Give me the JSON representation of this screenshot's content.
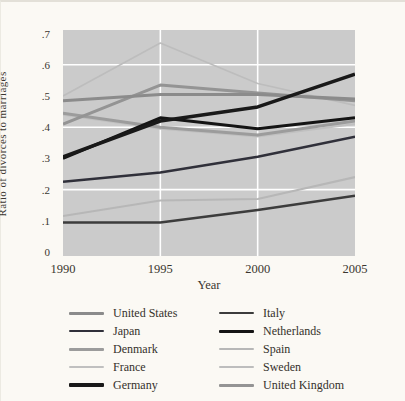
{
  "figure": {
    "ylabel": "Ratio of divorces to marriages",
    "xlabel": "Year"
  },
  "colors": {
    "page_bg": "#fbf9f4",
    "plot_bg": "#cbcbcb",
    "grid": "#ffffff",
    "text": "#35312b"
  },
  "chart_data": {
    "type": "line",
    "title": "",
    "xlabel": "Year",
    "ylabel": "Ratio of divorces to marriages",
    "x": [
      1990,
      1995,
      2000,
      2005
    ],
    "x_tick_labels": [
      "1990",
      "1995",
      "2000",
      "2005"
    ],
    "y_ticks": [
      {
        "v": 0.7,
        "label": ".7"
      },
      {
        "v": 0.6,
        "label": ".6"
      },
      {
        "v": 0.5,
        "label": ".5"
      },
      {
        "v": 0.4,
        "label": ".4"
      },
      {
        "v": 0.3,
        "label": ".3"
      },
      {
        "v": 0.2,
        "label": ".2"
      },
      {
        "v": 0.1,
        "label": ".1"
      },
      {
        "v": 0.0,
        "label": "0"
      }
    ],
    "ylim": [
      0,
      0.72
    ],
    "grid": {
      "horizontal_values": [
        0.2,
        0.4,
        0.6
      ],
      "vertical_years": [
        1995,
        2000
      ]
    },
    "legend_position": "bottom-two-columns",
    "series": [
      {
        "name": "United States",
        "color": "#8b8b8b",
        "width": 3,
        "values": [
          0.485,
          0.505,
          0.505,
          0.49
        ]
      },
      {
        "name": "Japan",
        "color": "#30303a",
        "width": 2.5,
        "values": [
          0.225,
          0.255,
          0.305,
          0.37
        ]
      },
      {
        "name": "Denmark",
        "color": "#9c9c9c",
        "width": 3,
        "values": [
          0.445,
          0.4,
          0.375,
          0.42
        ]
      },
      {
        "name": "France",
        "color": "#c0c0c0",
        "width": 2,
        "values": [
          0.44,
          0.395,
          0.37,
          0.41
        ]
      },
      {
        "name": "Germany",
        "color": "#191919",
        "width": 3.5,
        "values": [
          0.305,
          0.42,
          0.465,
          0.57
        ]
      },
      {
        "name": "Italy",
        "color": "#3c3c3c",
        "width": 2.5,
        "values": [
          0.095,
          0.095,
          0.135,
          0.18
        ]
      },
      {
        "name": "Netherlands",
        "color": "#141414",
        "width": 3,
        "values": [
          0.3,
          0.43,
          0.395,
          0.43
        ]
      },
      {
        "name": "Spain",
        "color": "#b7b7b7",
        "width": 2,
        "values": [
          0.115,
          0.165,
          0.17,
          0.24
        ]
      },
      {
        "name": "Sweden",
        "color": "#bdbdbd",
        "width": 1.6,
        "values": [
          0.5,
          0.67,
          0.54,
          0.47
        ]
      },
      {
        "name": "United Kingdom",
        "color": "#949494",
        "width": 3,
        "values": [
          0.41,
          0.535,
          0.51,
          0.485
        ]
      }
    ],
    "draw_order": [
      "Sweden",
      "Spain",
      "France",
      "Denmark",
      "United Kingdom",
      "United States",
      "Japan",
      "Italy",
      "Netherlands",
      "Germany"
    ],
    "legend_columns": [
      [
        "United States",
        "Japan",
        "Denmark",
        "France",
        "Germany"
      ],
      [
        "Italy",
        "Netherlands",
        "Spain",
        "Sweden",
        "United Kingdom"
      ]
    ]
  }
}
